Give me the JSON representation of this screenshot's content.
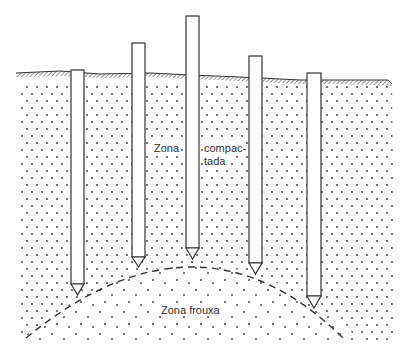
{
  "diagram": {
    "type": "cross-section",
    "labels": {
      "compacted_zone_line1": "Zona",
      "compacted_zone_line2a": "compac-",
      "compacted_zone_line2b": "tada",
      "loose_zone": "Zona frouxa"
    },
    "piles": [
      {
        "id": 1,
        "x": 71,
        "width": 13,
        "top": 70,
        "body_bottom": 284,
        "tip": 295
      },
      {
        "id": 2,
        "x": 132,
        "width": 13,
        "top": 43,
        "body_bottom": 257,
        "tip": 267
      },
      {
        "id": 3,
        "x": 186,
        "width": 13,
        "top": 16,
        "body_bottom": 248,
        "tip": 259
      },
      {
        "id": 4,
        "x": 249,
        "width": 13,
        "top": 56,
        "body_bottom": 263,
        "tip": 274
      },
      {
        "id": 5,
        "x": 307,
        "width": 14,
        "top": 73,
        "body_bottom": 296,
        "tip": 308
      }
    ],
    "colors": {
      "line": "#333333",
      "dots": "#333333",
      "background": "#ffffff"
    }
  }
}
